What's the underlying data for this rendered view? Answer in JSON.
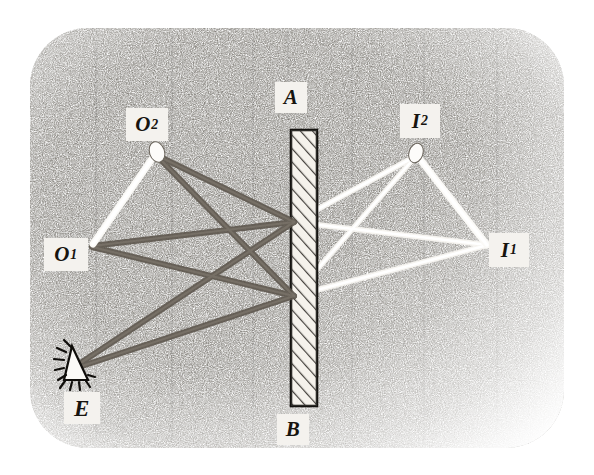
{
  "figure": {
    "medium": "stippled pencil / engraved line drawing",
    "canvas": {
      "width": 594,
      "height": 475
    },
    "background": {
      "paper_color": "#ffffff",
      "stipple_color": "#2a2723",
      "plate_rect": {
        "x": 30,
        "y": 28,
        "width": 534,
        "height": 420,
        "corner_radius": 58
      },
      "description": "rounded-corner rectangular stippled field, darkest at upper-left and centre, fading to white at the margins"
    },
    "mirror": {
      "name": "mirror",
      "label_top": "A",
      "label_bottom": "B",
      "rect": {
        "x": 291,
        "y": 130,
        "width": 26,
        "height": 276
      },
      "fill": "#f2efe9",
      "edge_color": "#151310",
      "hatching": {
        "style": "diagonal",
        "direction": "lower-left to upper-right",
        "spacing_px": 9,
        "color": "#3a3631"
      }
    },
    "eye": {
      "name": "observer-eye",
      "label": "E",
      "position": {
        "x": 80,
        "y": 365
      },
      "shape": "triangular eye outline with lashes",
      "color": "#0e0c0a"
    },
    "objects": [
      {
        "id": "O2",
        "label": "O",
        "subscript": "2",
        "kind": "object-point",
        "marker": "white elliptical flame/candle head",
        "position": {
          "x": 157,
          "y": 153
        },
        "label_box": {
          "x": 126,
          "y": 108,
          "width": 40,
          "height": 32
        }
      },
      {
        "id": "O1",
        "label": "O",
        "subscript": "1",
        "kind": "object-point",
        "marker": "line end point",
        "position": {
          "x": 92,
          "y": 244
        },
        "label_box": {
          "x": 44,
          "y": 238,
          "width": 42,
          "height": 32
        }
      }
    ],
    "images": [
      {
        "id": "I2",
        "label": "I",
        "subscript": "2",
        "kind": "virtual-image-point",
        "marker": "white elliptical flame/candle head",
        "position": {
          "x": 416,
          "y": 154
        },
        "label_box": {
          "x": 402,
          "y": 105,
          "width": 38,
          "height": 34
        }
      },
      {
        "id": "I1",
        "label": "I",
        "subscript": "1",
        "kind": "virtual-image-point",
        "marker": "line end point",
        "position": {
          "x": 488,
          "y": 245
        },
        "label_box": {
          "x": 490,
          "y": 234,
          "width": 38,
          "height": 34
        }
      }
    ],
    "mirror_labels": [
      {
        "id": "A",
        "label": "A",
        "label_box": {
          "x": 275,
          "y": 82,
          "width": 32,
          "height": 31
        }
      },
      {
        "id": "B",
        "label": "B",
        "label_box": {
          "x": 277,
          "y": 414,
          "width": 32,
          "height": 31
        }
      }
    ],
    "eye_label_box": {
      "x": 64,
      "y": 392,
      "width": 36,
      "height": 32
    },
    "reflection_points": [
      {
        "id": "P_upper",
        "x": 294,
        "y": 222
      },
      {
        "id": "P_lower",
        "x": 294,
        "y": 296
      }
    ],
    "rays": {
      "incident_color": "#59524a",
      "virtual_color": "#f7f5f1",
      "incident": [
        {
          "from": "O2",
          "to": "P_upper",
          "note": "object 2 to mirror"
        },
        {
          "from": "P_upper",
          "to": "E",
          "note": "reflected to eye"
        },
        {
          "from": "O2",
          "to": "P_lower",
          "note": "object 2 to mirror, lower point"
        },
        {
          "from": "P_lower",
          "to": "E",
          "note": "reflected to eye"
        },
        {
          "from": "O1",
          "to": "P_upper",
          "note": "object 1 to mirror"
        },
        {
          "from": "O1",
          "to": "P_lower",
          "note": "object 1 to mirror, lower point"
        }
      ],
      "virtual_extensions": [
        {
          "from": "P_upper",
          "to": "I2",
          "note": "apparent ray behind mirror to image 2"
        },
        {
          "from": "P_lower",
          "to": "I2",
          "note": "apparent ray behind mirror to image 2"
        },
        {
          "from": "P_upper",
          "to": "I1",
          "note": "apparent ray behind mirror to image 1"
        },
        {
          "from": "P_lower",
          "to": "I1",
          "note": "apparent ray behind mirror to image 1"
        }
      ]
    }
  }
}
